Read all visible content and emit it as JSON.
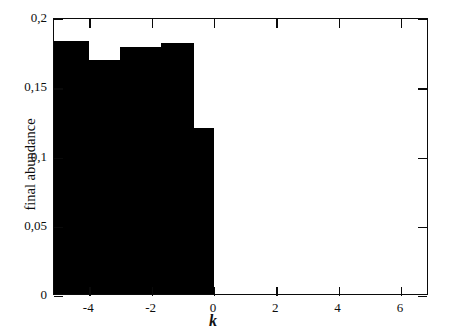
{
  "chart_data": {
    "type": "bar",
    "title": "",
    "subtitle": "",
    "xlabel": "k",
    "ylabel": "final abundance",
    "xlim": [
      -5.13,
      6.9
    ],
    "ylim": [
      0,
      0.2
    ],
    "grid": false,
    "legend": null,
    "decimal_separator": ",",
    "bar_color": "#000000",
    "axis_color": "#0a0a0a",
    "background": "#ffffff",
    "xticks": [
      -4,
      -2,
      0,
      2,
      4,
      6
    ],
    "xticklabels": [
      "-4",
      "-2",
      "0",
      "2",
      "4",
      "6"
    ],
    "yticks": [
      0,
      0.05,
      0.1,
      0.15,
      0.2
    ],
    "yticklabels": [
      "0",
      "0,05",
      "0,1",
      "0,15",
      "0,2"
    ],
    "bars": [
      {
        "x_start": -5.13,
        "x_end": -4.0,
        "value": 0.183
      },
      {
        "x_start": -4.0,
        "x_end": -3.0,
        "value": 0.169
      },
      {
        "x_start": -3.0,
        "x_end": -1.7,
        "value": 0.178
      },
      {
        "x_start": -1.7,
        "x_end": -0.65,
        "value": 0.181
      },
      {
        "x_start": -0.65,
        "x_end": 0.0,
        "value": 0.12
      }
    ],
    "categories": [
      "-5.13..-4",
      "-4..-3",
      "-3..-1.7",
      "-1.7..-0.65",
      "-0.65..0"
    ],
    "values": [
      0.183,
      0.169,
      0.178,
      0.181,
      0.12
    ]
  }
}
